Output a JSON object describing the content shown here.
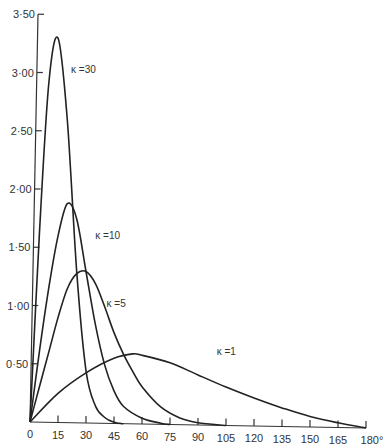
{
  "chart_data": {
    "type": "line",
    "title": "",
    "xlabel": "",
    "ylabel": "",
    "xlim": [
      0,
      180
    ],
    "ylim": [
      0,
      3.5
    ],
    "grid": false,
    "legend": "inline curve labels",
    "x_ticks": [
      0,
      15,
      30,
      45,
      60,
      75,
      90,
      105,
      120,
      135,
      150,
      165,
      180
    ],
    "x_tick_labels": [
      "0",
      "15",
      "30",
      "45",
      "60",
      "75",
      "90",
      "105",
      "120",
      "135",
      "150",
      "165",
      "180°"
    ],
    "y_ticks": [
      0.5,
      1.0,
      1.5,
      2.0,
      2.5,
      3.0,
      3.5
    ],
    "y_tick_labels": [
      "0·50",
      "1·00",
      "1·50",
      "2·00",
      "2·50",
      "3·00",
      "3·50"
    ],
    "origin_label": "0",
    "series": [
      {
        "name": "κ=30",
        "label": "κ =30",
        "label_pos": [
          22,
          3.0
        ],
        "x": [
          0,
          5,
          10,
          15,
          20,
          25,
          30,
          35,
          40,
          45,
          50
        ],
        "values": [
          0,
          1.6,
          2.9,
          3.3,
          2.6,
          1.3,
          0.45,
          0.15,
          0.05,
          0.01,
          0
        ]
      },
      {
        "name": "κ=10",
        "label": "κ =10",
        "label_pos": [
          35,
          1.58
        ],
        "x": [
          0,
          5,
          10,
          15,
          20,
          25,
          30,
          35,
          40,
          45,
          50,
          60,
          70,
          75
        ],
        "values": [
          0,
          0.6,
          1.15,
          1.6,
          1.88,
          1.75,
          1.3,
          0.85,
          0.5,
          0.28,
          0.15,
          0.05,
          0.01,
          0
        ]
      },
      {
        "name": "κ=5",
        "label": "κ =5",
        "label_pos": [
          41,
          1.0
        ],
        "x": [
          0,
          5,
          10,
          15,
          20,
          25,
          30,
          35,
          40,
          45,
          50,
          55,
          60,
          70,
          80,
          90,
          105
        ],
        "values": [
          0,
          0.3,
          0.6,
          0.9,
          1.15,
          1.28,
          1.3,
          1.2,
          1.0,
          0.78,
          0.6,
          0.45,
          0.32,
          0.15,
          0.06,
          0.02,
          0
        ]
      },
      {
        "name": "κ=1",
        "label": "κ =1",
        "label_pos": [
          100,
          0.6
        ],
        "x": [
          0,
          15,
          30,
          45,
          55,
          60,
          75,
          90,
          105,
          120,
          135,
          150,
          165,
          180
        ],
        "values": [
          0,
          0.25,
          0.43,
          0.56,
          0.6,
          0.59,
          0.53,
          0.43,
          0.33,
          0.24,
          0.16,
          0.09,
          0.04,
          0
        ]
      }
    ]
  },
  "colors": {
    "line": "#222222",
    "axis": "#333333",
    "text": "#333333",
    "background": "#ffffff"
  }
}
